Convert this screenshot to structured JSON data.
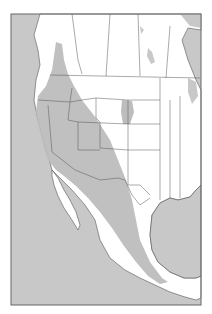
{
  "map": {
    "type": "range-map",
    "region": "Western North America (Canada, United States, Mexico)",
    "colors": {
      "water": "#c8c8c8",
      "land": "#ffffff",
      "range": "#c4c4c4",
      "borders": "#555555",
      "frame": "#666666"
    },
    "legend": []
  }
}
